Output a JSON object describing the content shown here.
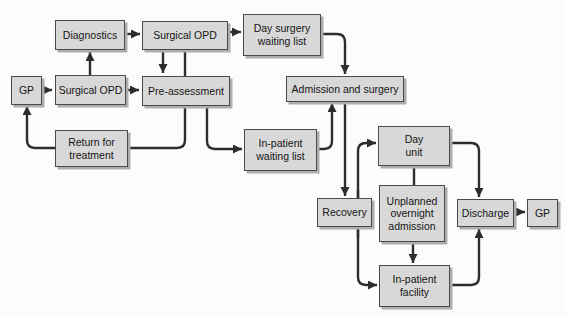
{
  "diagram": {
    "type": "flowchart",
    "colors": {
      "background": "#fcfcfb",
      "node_fill": "#d8d8d8",
      "node_border": "#4a4a4a",
      "node_shadow": "#adadad",
      "connector": "#2d2d2d",
      "text": "#151515"
    },
    "nodes": [
      {
        "id": "gp-left",
        "label": "GP"
      },
      {
        "id": "diagnostics",
        "label": "Diagnostics"
      },
      {
        "id": "surgical-opd-upper",
        "label": "Surgical OPD"
      },
      {
        "id": "day-surgery-waiting-list",
        "label": "Day surgery\nwaiting list"
      },
      {
        "id": "surgical-opd-lower",
        "label": "Surgical OPD"
      },
      {
        "id": "pre-assessment",
        "label": "Pre-assessment"
      },
      {
        "id": "admission-and-surgery",
        "label": "Admission and surgery"
      },
      {
        "id": "return-for-treatment",
        "label": "Return for\ntreatment"
      },
      {
        "id": "in-patient-waiting-list",
        "label": "In-patient\nwaiting list"
      },
      {
        "id": "day-unit",
        "label": "Day\nunit"
      },
      {
        "id": "recovery",
        "label": "Recovery"
      },
      {
        "id": "unplanned-overnight-admission",
        "label": "Unplanned\novernight\nadmission"
      },
      {
        "id": "discharge",
        "label": "Discharge"
      },
      {
        "id": "gp-right",
        "label": "GP"
      },
      {
        "id": "in-patient-facility",
        "label": "In-patient\nfacility"
      }
    ],
    "edges": [
      {
        "from": "gp-left",
        "to": "surgical-opd-lower",
        "style": "arrow"
      },
      {
        "from": "surgical-opd-lower",
        "to": "diagnostics",
        "style": "arrow"
      },
      {
        "from": "diagnostics",
        "to": "surgical-opd-upper",
        "style": "arrow"
      },
      {
        "from": "surgical-opd-upper",
        "to": "day-surgery-waiting-list",
        "style": "arrow"
      },
      {
        "from": "surgical-opd-upper",
        "to": "pre-assessment",
        "style": "arrow"
      },
      {
        "from": "surgical-opd-upper",
        "to": "pre-assessment",
        "style": "plain-line"
      },
      {
        "from": "surgical-opd-lower",
        "to": "pre-assessment",
        "style": "arrow"
      },
      {
        "from": "pre-assessment",
        "to": "return-for-treatment",
        "style": "plain-line"
      },
      {
        "from": "pre-assessment",
        "to": "in-patient-waiting-list",
        "style": "arrow"
      },
      {
        "from": "return-for-treatment",
        "to": "gp-left",
        "style": "arrow"
      },
      {
        "from": "day-surgery-waiting-list",
        "to": "admission-and-surgery",
        "style": "arrow"
      },
      {
        "from": "in-patient-waiting-list",
        "to": "admission-and-surgery",
        "style": "arrow"
      },
      {
        "from": "admission-and-surgery",
        "to": "recovery",
        "style": "arrow"
      },
      {
        "from": "recovery",
        "to": "day-unit",
        "style": "arrow"
      },
      {
        "from": "recovery",
        "to": "in-patient-facility",
        "style": "arrow"
      },
      {
        "from": "day-unit",
        "to": "unplanned-overnight-admission",
        "style": "plain-line"
      },
      {
        "from": "day-unit",
        "to": "discharge",
        "style": "arrow"
      },
      {
        "from": "unplanned-overnight-admission",
        "to": "in-patient-facility",
        "style": "arrow"
      },
      {
        "from": "in-patient-facility",
        "to": "discharge",
        "style": "arrow"
      },
      {
        "from": "discharge",
        "to": "gp-right",
        "style": "arrow"
      }
    ]
  }
}
